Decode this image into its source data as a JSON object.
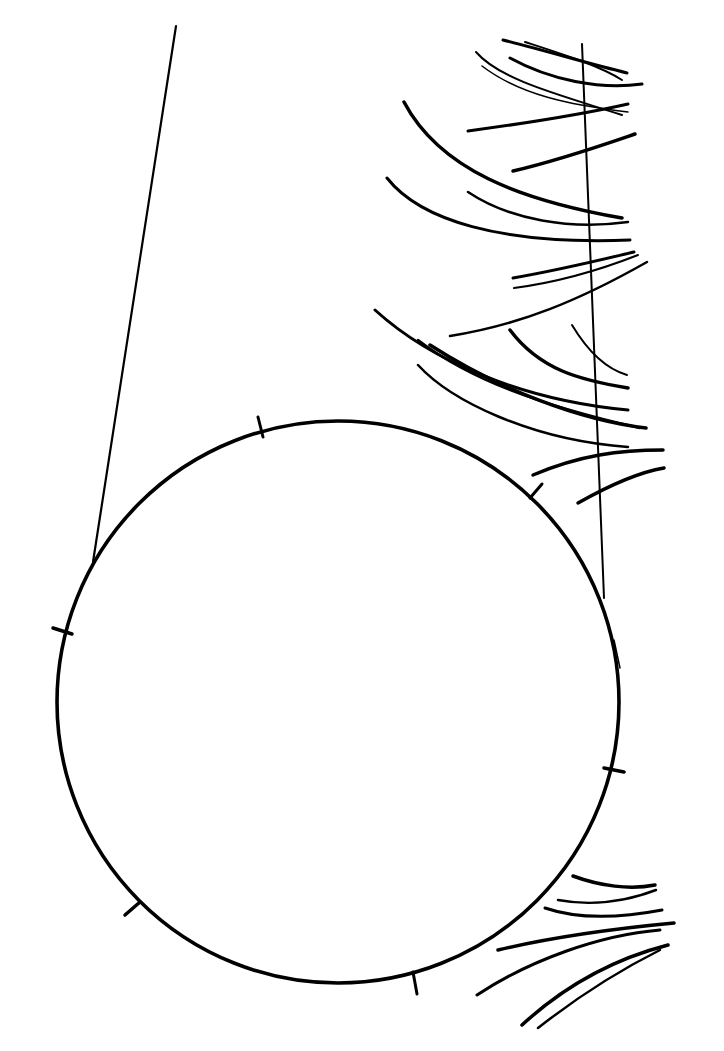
{
  "canvas": {
    "width": 724,
    "height": 1051,
    "background": "#ffffff",
    "ink_color": "#000000"
  },
  "illustration": {
    "style": "hand-drawn pen sketch",
    "elements": [
      "circle-with-tick-marks",
      "left-tangent-line",
      "right-vertical-line",
      "upper-right-feather-strokes",
      "lower-right-feather-strokes"
    ],
    "circle": {
      "cx": 338,
      "cy": 700,
      "r": 280,
      "tick_count": 6
    },
    "text": []
  }
}
